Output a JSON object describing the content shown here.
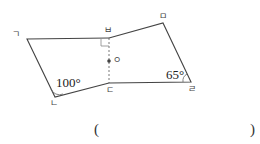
{
  "figure": {
    "vertices": {
      "giyeok": {
        "label": "ㄱ",
        "x": 27,
        "y": 39
      },
      "nieun": {
        "label": "ㄴ",
        "x": 55,
        "y": 97
      },
      "digeut": {
        "label": "ㄷ",
        "x": 109,
        "y": 83
      },
      "rieul": {
        "label": "ㄹ",
        "x": 191,
        "y": 82
      },
      "mieum": {
        "label": "ㅁ",
        "x": 163,
        "y": 23
      },
      "bieup": {
        "label": "ㅂ",
        "x": 109,
        "y": 38
      }
    },
    "center_point": {
      "label": "ㅇ",
      "x": 109,
      "y": 61
    },
    "angles": {
      "at_nieun": "100°",
      "at_rieul": "65°"
    },
    "right_angle_mark_at": "ㅂ",
    "dashed_segment": "ㅂㄷ"
  },
  "answer_box": {
    "open": "(",
    "close": ")",
    "value": ""
  }
}
